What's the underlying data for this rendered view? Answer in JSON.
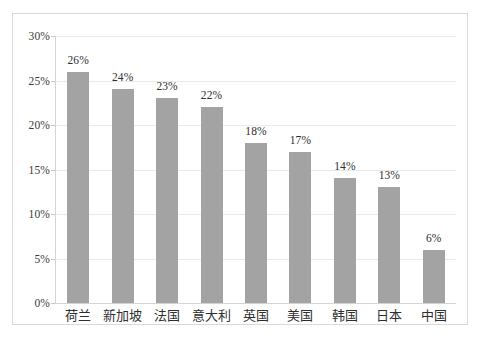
{
  "chart_data": {
    "type": "bar",
    "title": "",
    "subtitle": "",
    "xlabel": "",
    "ylabel": "",
    "categories": [
      "荷兰",
      "新加坡",
      "法国",
      "意大利",
      "英国",
      "美国",
      "韩国",
      "日本",
      "中国"
    ],
    "values": [
      26,
      24,
      23,
      22,
      18,
      17,
      14,
      13,
      6
    ],
    "data_labels": [
      "26%",
      "24%",
      "23%",
      "22%",
      "18%",
      "17%",
      "14%",
      "13%",
      "6%"
    ],
    "ylim": [
      0,
      30
    ],
    "ytick_values": [
      0,
      5,
      10,
      15,
      20,
      25,
      30
    ],
    "ytick_labels": [
      "0%",
      "5%",
      "10%",
      "15%",
      "20%",
      "25%",
      "30%"
    ],
    "grid": true,
    "legend": null,
    "series_color": "#a3a3a3",
    "gridline_color": "#e9e9e9",
    "axis_color": "#d4d4d4",
    "border_color": "#d9d9d9",
    "background_color": "#ffffff",
    "text_color": "#2e2e2e"
  }
}
